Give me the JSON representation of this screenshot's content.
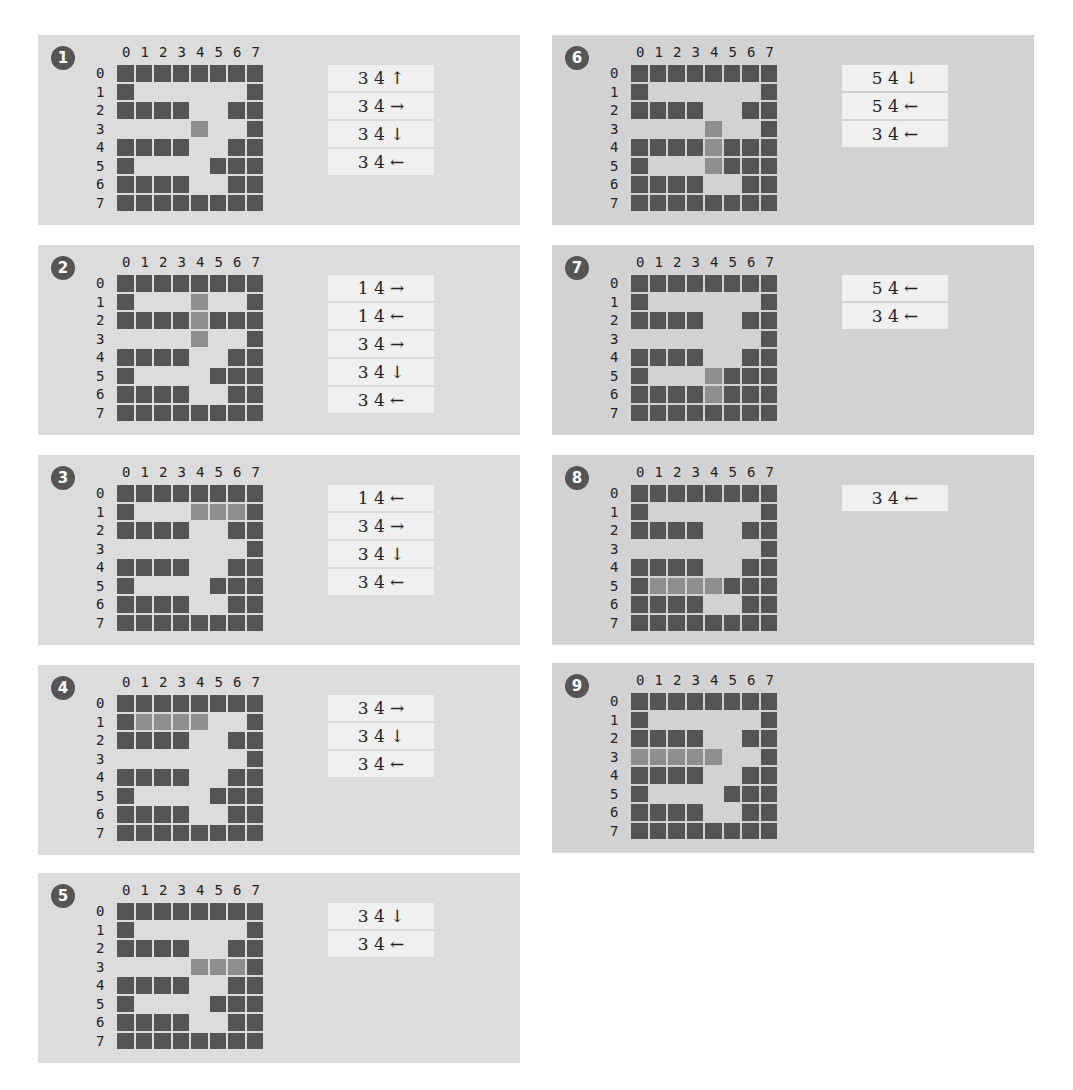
{
  "colors": {
    "panel_bg_left": "#dcdcdc",
    "panel_bg_right": "#d2d2d2",
    "wall": "#555555",
    "visited": "#8e8e8e",
    "stack_item_bg": "#f0f0f0",
    "badge_bg": "#555555"
  },
  "col_labels": [
    "0",
    "1",
    "2",
    "3",
    "4",
    "5",
    "6",
    "7"
  ],
  "row_labels": [
    "0",
    "1",
    "2",
    "3",
    "4",
    "5",
    "6",
    "7"
  ],
  "legend": {
    "w": "wall",
    "e": "empty",
    "v": "visited-current-path"
  },
  "panels": [
    {
      "step": "1",
      "grid": [
        "wwwwwwww",
        "weeeeeew",
        "wwwweeww",
        "eeeeveew",
        "wwwweeww",
        "weeeewww",
        "wwwweeww",
        "wwwwwwww"
      ],
      "stack": [
        "3 4 ↑",
        "3 4 →",
        "3 4 ↓",
        "3 4 ←"
      ]
    },
    {
      "step": "2",
      "grid": [
        "wwwwwwww",
        "weeeveew",
        "wwwwvwww",
        "eeeeveew",
        "wwwweeww",
        "weeeewww",
        "wwwweeww",
        "wwwwwwww"
      ],
      "stack": [
        "1 4 →",
        "1 4 ←",
        "3 4 →",
        "3 4 ↓",
        "3 4 ←"
      ]
    },
    {
      "step": "3",
      "grid": [
        "wwwwwwww",
        "weeevvvw",
        "wwwweeww",
        "eeeeeeew",
        "wwwweeww",
        "weeeewww",
        "wwwweeww",
        "wwwwwwww"
      ],
      "stack": [
        "1 4 ←",
        "3 4 →",
        "3 4 ↓",
        "3 4 ←"
      ]
    },
    {
      "step": "4",
      "grid": [
        "wwwwwwww",
        "wvvvveew",
        "wwwweeww",
        "eeeeeeew",
        "wwwweeww",
        "weeeewww",
        "wwwweeww",
        "wwwwwwww"
      ],
      "stack": [
        "3 4 →",
        "3 4 ↓",
        "3 4 ←"
      ]
    },
    {
      "step": "5",
      "grid": [
        "wwwwwwww",
        "weeeeeew",
        "wwwweeww",
        "eeeevvvw",
        "wwwweeww",
        "weeeewww",
        "wwwweeww",
        "wwwwwwww"
      ],
      "stack": [
        "3 4 ↓",
        "3 4 ←"
      ]
    },
    {
      "step": "6",
      "grid": [
        "wwwwwwww",
        "weeeeeew",
        "wwwweeww",
        "eeeeveew",
        "wwwwvwww",
        "weeevwww",
        "wwwweeww",
        "wwwwwwww"
      ],
      "stack": [
        "5 4 ↓",
        "5 4 ←",
        "3 4 ←"
      ]
    },
    {
      "step": "7",
      "grid": [
        "wwwwwwww",
        "weeeeeew",
        "wwwweeww",
        "eeeeeeew",
        "wwwweeww",
        "weeevwww",
        "wwwwvwww",
        "wwwwwwww"
      ],
      "stack": [
        "5 4 ←",
        "3 4 ←"
      ]
    },
    {
      "step": "8",
      "grid": [
        "wwwwwwww",
        "weeeeeew",
        "wwwweeww",
        "eeeeeeew",
        "wwwweeww",
        "wvvvvwww",
        "wwwweeww",
        "wwwwwwww"
      ],
      "stack": [
        "3 4 ←"
      ]
    },
    {
      "step": "9",
      "grid": [
        "wwwwwwww",
        "weeeeeew",
        "wwwweeww",
        "vvvvveew",
        "wwwweeww",
        "weeeewww",
        "wwwweeww",
        "wwwwwwww"
      ],
      "stack": []
    }
  ]
}
